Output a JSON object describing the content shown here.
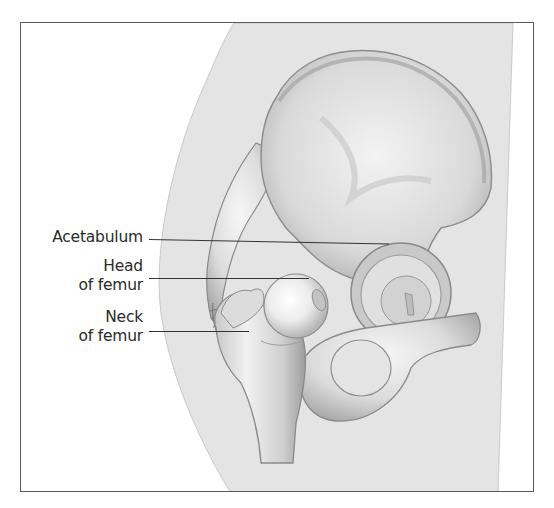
{
  "figure": {
    "labels": [
      {
        "id": "acetabulum",
        "lines": [
          "Acetabulum"
        ]
      },
      {
        "id": "head-of-femur",
        "lines": [
          "Head",
          "of femur"
        ]
      },
      {
        "id": "neck-of-femur",
        "lines": [
          "Neck",
          "of femur"
        ]
      }
    ]
  },
  "colors": {
    "frame_border": "#5a5a5a",
    "body_silhouette": "#e4e4e4",
    "bone_light": "#f4f4f4",
    "bone_mid": "#cfcfcf",
    "bone_dark": "#9a9a9a",
    "leader_line": "#333333",
    "label_text": "#2a2a2a"
  }
}
